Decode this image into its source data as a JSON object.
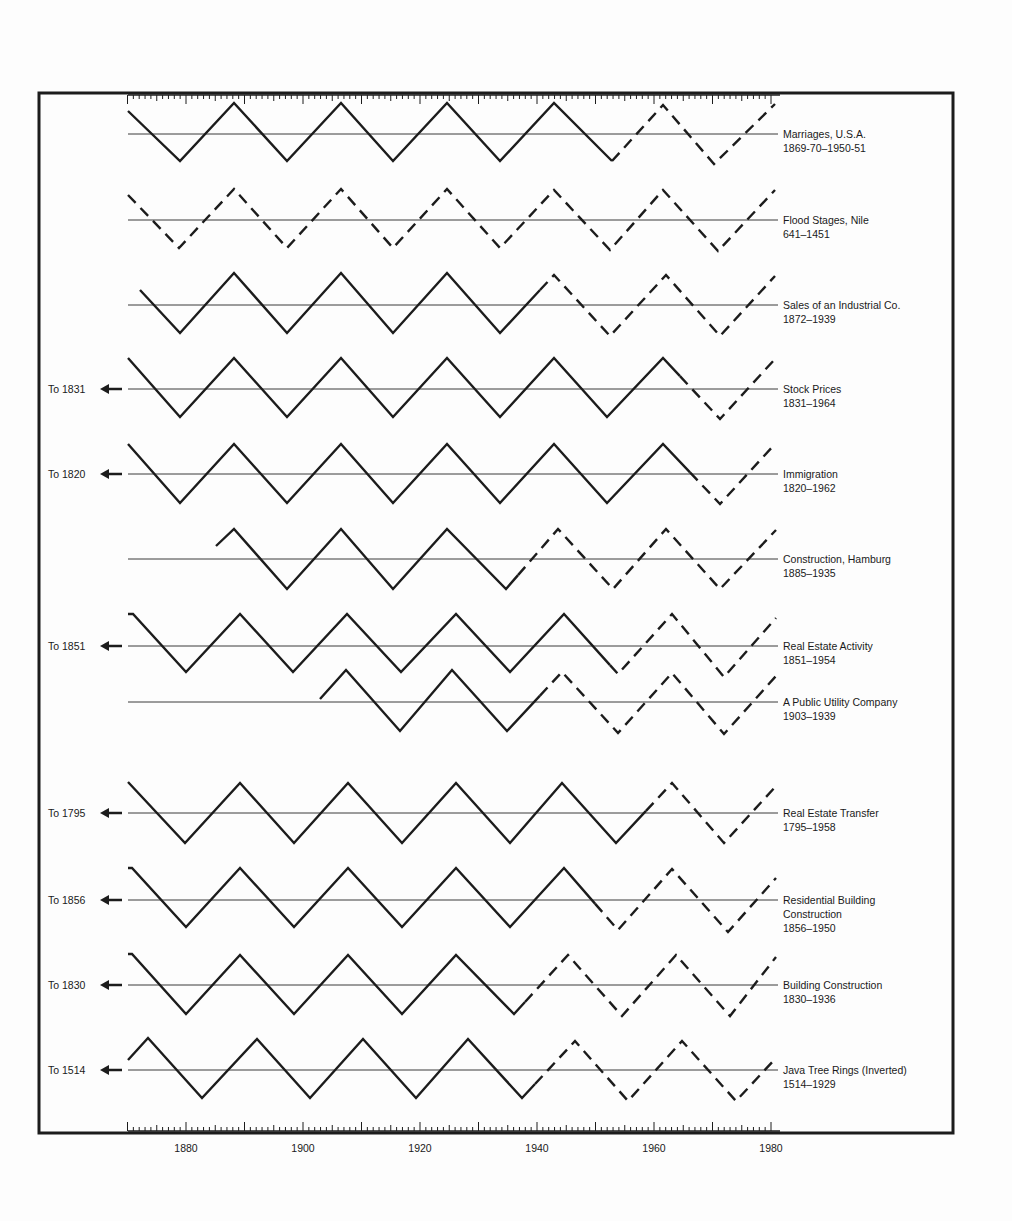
{
  "chart_data": {
    "type": "line",
    "title": "",
    "xlabel": "",
    "ylabel": "",
    "xlim": [
      1870,
      1980
    ],
    "x_ticks": [
      1880,
      1900,
      1920,
      1940,
      1960,
      1980
    ],
    "grid": false,
    "legend": "none (series labels at right edge of each row)",
    "series": [
      {
        "name": "Marriages, U.S.A.",
        "range": "1869-70–1950-51",
        "start_year": 1870,
        "phase": "falling",
        "dashed_from": 1950,
        "left_note": ""
      },
      {
        "name": "Flood Stages, Nile",
        "range": "641–1451",
        "start_year": 1870,
        "phase": "falling",
        "dashed_from": 1870,
        "left_note": ""
      },
      {
        "name": "Sales of an Industrial Co.",
        "range": "1872–1939",
        "start_year": 1872,
        "phase": "falling",
        "dashed_from": 1940,
        "left_note": ""
      },
      {
        "name": "Stock Prices",
        "range": "1831–1964",
        "start_year": 1870,
        "phase": "falling",
        "dashed_from": 1964,
        "left_note": "To 1831"
      },
      {
        "name": "Immigration",
        "range": "1820–1962",
        "start_year": 1870,
        "phase": "falling",
        "dashed_from": 1962,
        "left_note": "To 1820"
      },
      {
        "name": "Construction, Hamburg",
        "range": "1885–1935",
        "start_year": 1885,
        "phase": "rising",
        "dashed_from": 1935,
        "left_note": ""
      },
      {
        "name": "Real Estate Activity",
        "range": "1851–1954",
        "start_year": 1870,
        "phase": "falling",
        "dashed_from": 1954,
        "left_note": "To 1851"
      },
      {
        "name": "A Public Utility Company",
        "range": "1903–1939",
        "start_year": 1903,
        "phase": "rising",
        "dashed_from": 1939,
        "left_note": ""
      },
      {
        "name": "Real Estate Transfer",
        "range": "1795–1958",
        "start_year": 1870,
        "phase": "falling",
        "dashed_from": 1958,
        "left_note": "To 1795"
      },
      {
        "name": "Residential Building Construction",
        "range": "1856–1950",
        "start_year": 1870,
        "phase": "falling",
        "dashed_from": 1950,
        "left_note": "To 1856"
      },
      {
        "name": "Building Construction",
        "range": "1830–1936",
        "start_year": 1870,
        "phase": "falling",
        "dashed_from": 1936,
        "left_note": "To 1830"
      },
      {
        "name": "Java Tree Rings (Inverted)",
        "range": "1514–1929",
        "start_year": 1870,
        "phase": "rising",
        "dashed_from": 1929,
        "left_note": "To 1514"
      }
    ]
  },
  "rows": [
    {
      "label1": "Marriages, U.S.A.",
      "label2": "1869-70–1950-51",
      "label3": "",
      "left": "",
      "pts": [
        [
          128,
          111
        ],
        [
          180,
          161
        ],
        [
          234,
          103
        ],
        [
          287,
          161
        ],
        [
          341,
          103
        ],
        [
          393,
          161
        ],
        [
          447,
          103
        ],
        [
          500,
          161
        ],
        [
          554,
          103
        ],
        [
          612,
          161
        ],
        [
          663,
          105
        ],
        [
          714,
          164
        ],
        [
          775,
          104
        ]
      ],
      "dash_from_idx": 9,
      "extra_dash_seg": [
        [
          554,
          103
        ],
        [
          612,
          161
        ]
      ],
      "solid_to_x": 600
    },
    {
      "label1": "Flood Stages, Nile",
      "label2": "641–1451",
      "label3": "",
      "left": "",
      "pts": [
        [
          128,
          195
        ],
        [
          179,
          248
        ],
        [
          234,
          189
        ],
        [
          287,
          248
        ],
        [
          341,
          189
        ],
        [
          393,
          248
        ],
        [
          447,
          189
        ],
        [
          500,
          248
        ],
        [
          554,
          190
        ],
        [
          610,
          250
        ],
        [
          663,
          190
        ],
        [
          718,
          251
        ],
        [
          775,
          190
        ]
      ],
      "dash_from_idx": 0
    },
    {
      "label1": "Sales of an Industrial Co.",
      "label2": "1872–1939",
      "label3": "",
      "left": "",
      "pts": [
        [
          140,
          290
        ],
        [
          180,
          333
        ],
        [
          234,
          273
        ],
        [
          287,
          333
        ],
        [
          341,
          273
        ],
        [
          393,
          333
        ],
        [
          447,
          273
        ],
        [
          500,
          333
        ],
        [
          554,
          275
        ],
        [
          610,
          336
        ],
        [
          666,
          275
        ],
        [
          720,
          336
        ],
        [
          775,
          276
        ]
      ],
      "dash_from_idx": 7,
      "partial_dash_x": 540
    },
    {
      "label1": "Stock Prices",
      "label2": "1831–1964",
      "label3": "",
      "left": "To 1831",
      "pts": [
        [
          128,
          358
        ],
        [
          180,
          417
        ],
        [
          234,
          358
        ],
        [
          287,
          417
        ],
        [
          341,
          358
        ],
        [
          393,
          417
        ],
        [
          447,
          358
        ],
        [
          500,
          417
        ],
        [
          554,
          358
        ],
        [
          607,
          417
        ],
        [
          663,
          358
        ],
        [
          720,
          419
        ],
        [
          775,
          359
        ]
      ],
      "dash_from_idx": 10,
      "partial_dash_x": 680
    },
    {
      "label1": "Immigration",
      "label2": "1820–1962",
      "label3": "",
      "left": "To 1820",
      "pts": [
        [
          128,
          444
        ],
        [
          180,
          503
        ],
        [
          234,
          444
        ],
        [
          287,
          503
        ],
        [
          341,
          444
        ],
        [
          393,
          503
        ],
        [
          447,
          444
        ],
        [
          500,
          503
        ],
        [
          554,
          444
        ],
        [
          607,
          503
        ],
        [
          663,
          444
        ],
        [
          720,
          504
        ],
        [
          775,
          444
        ]
      ],
      "dash_from_idx": 10,
      "partial_dash_x": 690
    },
    {
      "label1": "Construction, Hamburg",
      "label2": "1885–1935",
      "label3": "",
      "left": "",
      "pts": [
        [
          216,
          546
        ],
        [
          234,
          529
        ],
        [
          287,
          589
        ],
        [
          341,
          529
        ],
        [
          393,
          589
        ],
        [
          447,
          529
        ],
        [
          506,
          589
        ],
        [
          558,
          529
        ],
        [
          613,
          589
        ],
        [
          666,
          529
        ],
        [
          720,
          589
        ],
        [
          776,
          530
        ]
      ],
      "dash_from_idx": 6,
      "partial_dash_x": 518
    },
    {
      "label1": "Real Estate Activity",
      "label2": "1851–1954",
      "label3": "",
      "left": "To 1851",
      "pts": [
        [
          128,
          614
        ],
        [
          133,
          614
        ],
        [
          186,
          672
        ],
        [
          240,
          614
        ],
        [
          293,
          672
        ],
        [
          347,
          614
        ],
        [
          401,
          672
        ],
        [
          456,
          614
        ],
        [
          510,
          672
        ],
        [
          564,
          614
        ],
        [
          618,
          674
        ],
        [
          672,
          614
        ],
        [
          724,
          677
        ],
        [
          776,
          618
        ]
      ],
      "dash_from_idx": 8,
      "partial_dash_x": 610
    },
    {
      "label1": "A Public Utility Company",
      "label2": "1903–1939",
      "label3": "",
      "left": "",
      "pts": [
        [
          320,
          699
        ],
        [
          346,
          670
        ],
        [
          400,
          731
        ],
        [
          452,
          670
        ],
        [
          507,
          731
        ],
        [
          562,
          672
        ],
        [
          618,
          733
        ],
        [
          672,
          673
        ],
        [
          724,
          734
        ],
        [
          776,
          676
        ]
      ],
      "dash_from_idx": 4,
      "partial_dash_x": 540
    },
    {
      "label1": "Real Estate Transfer",
      "label2": "1795–1958",
      "label3": "",
      "left": "To 1795",
      "pts": [
        [
          128,
          782
        ],
        [
          185,
          843
        ],
        [
          240,
          783
        ],
        [
          294,
          843
        ],
        [
          348,
          783
        ],
        [
          402,
          843
        ],
        [
          456,
          783
        ],
        [
          510,
          843
        ],
        [
          562,
          783
        ],
        [
          616,
          843
        ],
        [
          672,
          783
        ],
        [
          724,
          843
        ],
        [
          776,
          786
        ]
      ],
      "dash_from_idx": 10,
      "partial_dash_x": 646
    },
    {
      "label1": "Residential Building",
      "label2": "Construction",
      "label3": "1856–1950",
      "left": "To 1856",
      "pts": [
        [
          128,
          868
        ],
        [
          132,
          868
        ],
        [
          186,
          927
        ],
        [
          240,
          868
        ],
        [
          294,
          927
        ],
        [
          348,
          868
        ],
        [
          402,
          927
        ],
        [
          456,
          868
        ],
        [
          510,
          927
        ],
        [
          564,
          868
        ],
        [
          618,
          930
        ],
        [
          672,
          869
        ],
        [
          728,
          932
        ],
        [
          776,
          878
        ]
      ],
      "dash_from_idx": 9,
      "partial_dash_x": 595
    },
    {
      "label1": "Building Construction",
      "label2": "1830–1936",
      "label3": "",
      "left": "To 1830",
      "pts": [
        [
          128,
          954
        ],
        [
          132,
          954
        ],
        [
          186,
          1014
        ],
        [
          240,
          955
        ],
        [
          294,
          1014
        ],
        [
          348,
          955
        ],
        [
          402,
          1014
        ],
        [
          456,
          955
        ],
        [
          514,
          1014
        ],
        [
          568,
          955
        ],
        [
          622,
          1016
        ],
        [
          676,
          955
        ],
        [
          730,
          1016
        ],
        [
          776,
          957
        ]
      ],
      "dash_from_idx": 8,
      "partial_dash_x": 525
    },
    {
      "label1": "Java Tree Rings (Inverted)",
      "label2": "1514–1929",
      "label3": "",
      "left": "To 1514",
      "pts": [
        [
          128,
          1060
        ],
        [
          148,
          1038
        ],
        [
          202,
          1098
        ],
        [
          257,
          1039
        ],
        [
          310,
          1098
        ],
        [
          363,
          1039
        ],
        [
          416,
          1098
        ],
        [
          468,
          1039
        ],
        [
          522,
          1098
        ],
        [
          575,
          1041
        ],
        [
          628,
          1101
        ],
        [
          682,
          1041
        ],
        [
          736,
          1101
        ],
        [
          776,
          1058
        ]
      ],
      "dash_from_idx": 8,
      "partial_dash_x": 535
    }
  ],
  "axis": {
    "ticks": [
      {
        "year": 1880,
        "label": "1880"
      },
      {
        "year": 1900,
        "label": "1900"
      },
      {
        "year": 1920,
        "label": "1920"
      },
      {
        "year": 1940,
        "label": "1940"
      },
      {
        "year": 1960,
        "label": "1960"
      },
      {
        "year": 1980,
        "label": "1980"
      }
    ]
  },
  "colors": {
    "ink": "#1c1c1c",
    "baseline": "#3a3a3a",
    "background": "#fdfdfd"
  }
}
